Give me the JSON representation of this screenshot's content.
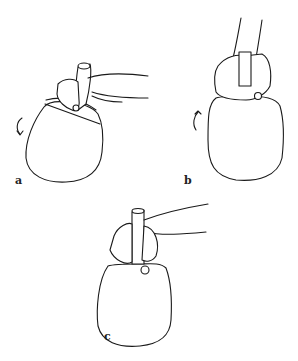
{
  "figure": {
    "panels": [
      {
        "label": "a",
        "arrow": "curved-rotation-arrow-down"
      },
      {
        "label": "b",
        "arrow": "curved-rotation-arrow-up"
      },
      {
        "label": "c",
        "arrow": null
      }
    ]
  }
}
